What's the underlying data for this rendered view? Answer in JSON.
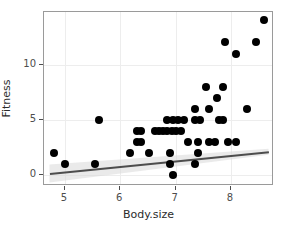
{
  "chart_data": {
    "type": "scatter",
    "title": "",
    "xlabel": "Body.size",
    "ylabel": "Fitness",
    "xlim": [
      4.62,
      8.78
    ],
    "ylim": [
      -0.95,
      14.75
    ],
    "xticks": [
      5,
      6,
      7,
      8
    ],
    "yticks": [
      0,
      5,
      10
    ],
    "grid": true,
    "legend": false,
    "point_color": "#000000",
    "fit_line_color": "#4d4d4d",
    "fit_band_color": "#d9d9d9",
    "panel_border_color": "#9a9a9a",
    "grid_color": "#ededed",
    "background": "#ffffff",
    "fit_line": {
      "x_start": 4.72,
      "y_start": 0.18,
      "x_end": 8.68,
      "y_end": 2.15
    },
    "points": [
      {
        "x": 4.8,
        "y": 2
      },
      {
        "x": 5.0,
        "y": 1
      },
      {
        "x": 5.55,
        "y": 1
      },
      {
        "x": 5.62,
        "y": 5
      },
      {
        "x": 6.18,
        "y": 2
      },
      {
        "x": 6.3,
        "y": 4
      },
      {
        "x": 6.38,
        "y": 4
      },
      {
        "x": 6.3,
        "y": 3
      },
      {
        "x": 6.38,
        "y": 3
      },
      {
        "x": 6.52,
        "y": 2
      },
      {
        "x": 6.62,
        "y": 4
      },
      {
        "x": 6.7,
        "y": 4
      },
      {
        "x": 6.78,
        "y": 4
      },
      {
        "x": 6.85,
        "y": 4
      },
      {
        "x": 6.93,
        "y": 4
      },
      {
        "x": 7.0,
        "y": 4
      },
      {
        "x": 7.1,
        "y": 4
      },
      {
        "x": 6.85,
        "y": 5
      },
      {
        "x": 6.95,
        "y": 5
      },
      {
        "x": 7.05,
        "y": 5
      },
      {
        "x": 7.15,
        "y": 5
      },
      {
        "x": 6.9,
        "y": 2
      },
      {
        "x": 6.9,
        "y": 1
      },
      {
        "x": 6.95,
        "y": 0
      },
      {
        "x": 7.22,
        "y": 3
      },
      {
        "x": 7.35,
        "y": 6
      },
      {
        "x": 7.35,
        "y": 5
      },
      {
        "x": 7.45,
        "y": 5
      },
      {
        "x": 7.4,
        "y": 3
      },
      {
        "x": 7.4,
        "y": 2
      },
      {
        "x": 7.35,
        "y": 1
      },
      {
        "x": 7.55,
        "y": 8
      },
      {
        "x": 7.6,
        "y": 6
      },
      {
        "x": 7.6,
        "y": 3
      },
      {
        "x": 7.72,
        "y": 3
      },
      {
        "x": 7.75,
        "y": 7
      },
      {
        "x": 7.78,
        "y": 5
      },
      {
        "x": 7.86,
        "y": 5
      },
      {
        "x": 7.85,
        "y": 8
      },
      {
        "x": 7.9,
        "y": 12
      },
      {
        "x": 7.95,
        "y": 3
      },
      {
        "x": 8.1,
        "y": 11
      },
      {
        "x": 8.1,
        "y": 3
      },
      {
        "x": 8.3,
        "y": 6
      },
      {
        "x": 8.45,
        "y": 12
      },
      {
        "x": 8.6,
        "y": 14
      }
    ]
  }
}
